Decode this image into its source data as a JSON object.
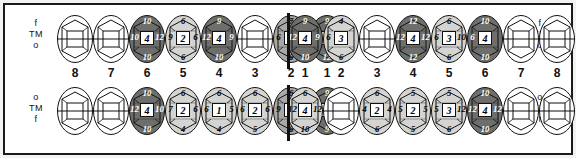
{
  "legend": {
    "upper_left": [
      "f",
      "TM",
      "o"
    ],
    "upper_right": [
      "f",
      "TM",
      "o"
    ],
    "lower_left": [
      "o",
      "TM",
      "f"
    ],
    "lower_right": [
      "o",
      "TM",
      "f"
    ]
  },
  "tooth_numbers": {
    "upper_left": [
      "8",
      "7",
      "6",
      "5",
      "4",
      "3",
      "2",
      "1"
    ],
    "upper_right": [
      "1",
      "2",
      "3",
      "4",
      "5",
      "6",
      "7",
      "8"
    ],
    "lower_left": [
      "8",
      "7",
      "6",
      "5",
      "4",
      "3",
      "2",
      "1"
    ],
    "lower_right": [
      "1",
      "2",
      "3",
      "4",
      "5",
      "6",
      "7",
      "8"
    ]
  },
  "shades": {
    "empty": "#ffffff",
    "light": "#d4d4d2",
    "medium": "#a8a8a6",
    "dark": "#6e6e6c",
    "outline": "#111111"
  },
  "chart_data": {
    "type": "table",
    "quadrants": [
      {
        "name": "upper-left",
        "teeth": [
          {
            "number": "8",
            "shade": "empty",
            "top": "",
            "left": "",
            "center": "",
            "right": "",
            "bottom": ""
          },
          {
            "number": "7",
            "shade": "empty",
            "top": "",
            "left": "",
            "center": "",
            "right": "",
            "bottom": ""
          },
          {
            "number": "6",
            "shade": "dark",
            "top": "10",
            "left": "10",
            "center": "4",
            "right": "12",
            "bottom": "10"
          },
          {
            "number": "5",
            "shade": "light",
            "top": "6",
            "left": "9",
            "center": "2",
            "right": "6",
            "bottom": "6"
          },
          {
            "number": "4",
            "shade": "dark",
            "top": "9",
            "left": "12",
            "center": "4",
            "right": "9",
            "bottom": "10"
          },
          {
            "number": "3",
            "shade": "empty",
            "top": "",
            "left": "",
            "center": "",
            "right": "",
            "bottom": ""
          },
          {
            "number": "2",
            "shade": "medium",
            "top": "7",
            "left": "6",
            "center": "3",
            "right": "9",
            "bottom": "6"
          },
          {
            "number": "1",
            "shade": "dark",
            "top": "9",
            "left": "9",
            "center": "4",
            "right": "10",
            "bottom": "12"
          }
        ]
      },
      {
        "name": "upper-right",
        "teeth": [
          {
            "number": "1",
            "shade": "dark",
            "top": "9",
            "left": "12",
            "center": "4",
            "right": "9",
            "bottom": "10"
          },
          {
            "number": "2",
            "shade": "light",
            "top": "4",
            "left": "6",
            "center": "3",
            "right": "",
            "bottom": "6"
          },
          {
            "number": "3",
            "shade": "empty",
            "top": "",
            "left": "",
            "center": "",
            "right": "",
            "bottom": ""
          },
          {
            "number": "4",
            "shade": "dark",
            "top": "12",
            "left": "12",
            "center": "4",
            "right": "12",
            "bottom": "12"
          },
          {
            "number": "5",
            "shade": "light",
            "top": "6",
            "left": "6",
            "center": "3",
            "right": "10",
            "bottom": "6"
          },
          {
            "number": "6",
            "shade": "dark",
            "top": "10",
            "left": "6",
            "center": "4",
            "right": "",
            "bottom": "10"
          },
          {
            "number": "7",
            "shade": "empty",
            "top": "",
            "left": "",
            "center": "",
            "right": "",
            "bottom": ""
          },
          {
            "number": "8",
            "shade": "empty",
            "top": "",
            "left": "",
            "center": "",
            "right": "",
            "bottom": ""
          }
        ]
      },
      {
        "name": "lower-left",
        "teeth": [
          {
            "number": "8",
            "shade": "empty",
            "top": "",
            "left": "",
            "center": "",
            "right": "",
            "bottom": ""
          },
          {
            "number": "7",
            "shade": "empty",
            "top": "",
            "left": "",
            "center": "",
            "right": "",
            "bottom": ""
          },
          {
            "number": "6",
            "shade": "dark",
            "top": "10",
            "left": "12",
            "center": "4",
            "right": "10",
            "bottom": "10"
          },
          {
            "number": "5",
            "shade": "light",
            "top": "6",
            "left": "7",
            "center": "2",
            "right": "6",
            "bottom": "4"
          },
          {
            "number": "4",
            "shade": "light",
            "top": "6",
            "left": "6",
            "center": "1",
            "right": "5",
            "bottom": "4"
          },
          {
            "number": "3",
            "shade": "light",
            "top": "6",
            "left": "6",
            "center": "2",
            "right": "6",
            "bottom": "5"
          },
          {
            "number": "2",
            "shade": "medium",
            "top": "6",
            "left": "9",
            "center": "3",
            "right": "9",
            "bottom": "6"
          },
          {
            "number": "1",
            "shade": "dark",
            "top": "9",
            "left": "10",
            "center": "4",
            "right": "12",
            "bottom": "9"
          }
        ]
      },
      {
        "name": "lower-right",
        "teeth": [
          {
            "number": "1",
            "shade": "light",
            "top": "6",
            "left": "12",
            "center": "4",
            "right": "12",
            "bottom": "10"
          },
          {
            "number": "2",
            "shade": "empty",
            "top": "",
            "left": "",
            "center": "",
            "right": "",
            "bottom": ""
          },
          {
            "number": "3",
            "shade": "light",
            "top": "6",
            "left": "4",
            "center": "2",
            "right": "4",
            "bottom": "6"
          },
          {
            "number": "4",
            "shade": "light",
            "top": "5",
            "left": "5",
            "center": "2",
            "right": "5",
            "bottom": "5"
          },
          {
            "number": "5",
            "shade": "light",
            "top": "5",
            "left": "5",
            "center": "3",
            "right": "12",
            "bottom": "6"
          },
          {
            "number": "6",
            "shade": "dark",
            "top": "10",
            "left": "12",
            "center": "4",
            "right": "12",
            "bottom": "10"
          },
          {
            "number": "7",
            "shade": "empty",
            "top": "",
            "left": "",
            "center": "",
            "right": "",
            "bottom": ""
          },
          {
            "number": "8",
            "shade": "empty",
            "top": "",
            "left": "",
            "center": "",
            "right": "",
            "bottom": ""
          }
        ]
      }
    ]
  }
}
